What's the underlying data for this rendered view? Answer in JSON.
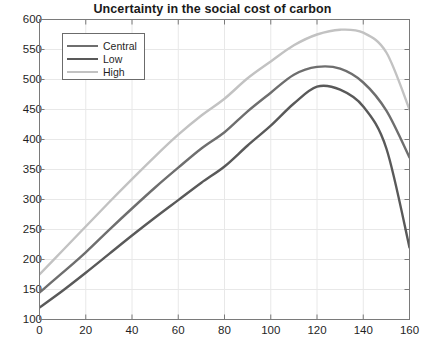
{
  "chart_data": {
    "type": "line",
    "title": "Uncertainty in the social cost of carbon",
    "xlabel": "",
    "ylabel": "",
    "xlim": [
      0,
      160
    ],
    "ylim": [
      100,
      600
    ],
    "xticks": [
      0,
      20,
      40,
      60,
      80,
      100,
      120,
      140,
      160
    ],
    "yticks": [
      100,
      150,
      200,
      250,
      300,
      350,
      400,
      450,
      500,
      550,
      600
    ],
    "grid": true,
    "legend_position": "upper-left",
    "x": [
      0,
      10,
      20,
      30,
      40,
      50,
      60,
      70,
      80,
      90,
      100,
      110,
      120,
      130,
      140,
      150,
      160
    ],
    "series": [
      {
        "name": "Central",
        "color": "#6e6e6e",
        "values": [
          145,
          178,
          212,
          249,
          285,
          320,
          353,
          385,
          412,
          447,
          478,
          508,
          521,
          518,
          495,
          448,
          370
        ]
      },
      {
        "name": "Low",
        "color": "#595959",
        "values": [
          120,
          148,
          178,
          209,
          240,
          270,
          299,
          328,
          355,
          390,
          423,
          460,
          488,
          483,
          455,
          385,
          220
        ]
      },
      {
        "name": "High",
        "color": "#c2c2c2",
        "values": [
          175,
          215,
          255,
          295,
          334,
          372,
          408,
          440,
          468,
          502,
          530,
          557,
          575,
          583,
          578,
          545,
          450
        ]
      }
    ]
  }
}
